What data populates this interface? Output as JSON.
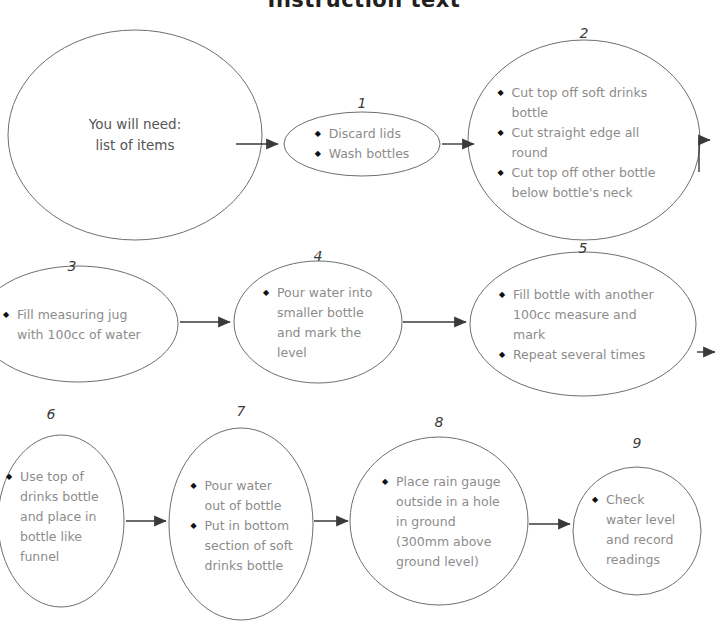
{
  "title": "Instruction text",
  "colors": {
    "text_grey": "#8c8c8c",
    "outline_grey": "#6d6e71",
    "arrow_dark": "#3a3a3a",
    "title_black": "#231f20",
    "bullet_black": "#111111"
  },
  "bullet_glyph": "◆",
  "nodes": [
    {
      "id": "start",
      "number": "",
      "kind": "plain",
      "lines": [
        "You will need:",
        "list of items"
      ]
    },
    {
      "id": "n1",
      "number": "1",
      "kind": "bullets",
      "bullets": [
        "Discard lids",
        "Wash bottles"
      ]
    },
    {
      "id": "n2",
      "number": "2",
      "kind": "bullets",
      "bullets": [
        "Cut top off soft drinks bottle",
        "Cut straight edge all round",
        "Cut top off other bottle below bottle's neck"
      ]
    },
    {
      "id": "n3",
      "number": "3",
      "kind": "bullets",
      "bullets": [
        "Fill measuring jug with 100cc of water"
      ]
    },
    {
      "id": "n4",
      "number": "4",
      "kind": "bullets",
      "bullets": [
        "Pour water into smaller bottle and mark the level"
      ]
    },
    {
      "id": "n5",
      "number": "5",
      "kind": "bullets",
      "bullets": [
        "Fill bottle with another 100cc measure and mark",
        "Repeat several times"
      ]
    },
    {
      "id": "n6",
      "number": "6",
      "kind": "bullets",
      "bullets": [
        "Use top of drinks bottle and place in bottle like funnel"
      ]
    },
    {
      "id": "n7",
      "number": "7",
      "kind": "bullets",
      "bullets": [
        "Pour water out of bottle",
        "Put in bottom section of soft drinks bottle"
      ]
    },
    {
      "id": "n8",
      "number": "8",
      "kind": "bullets",
      "bullets": [
        "Place rain gauge outside in a hole in ground (300mm above ground level)"
      ]
    },
    {
      "id": "n9",
      "number": "9",
      "kind": "bullets",
      "bullets": [
        "Check water level and record readings"
      ]
    }
  ]
}
